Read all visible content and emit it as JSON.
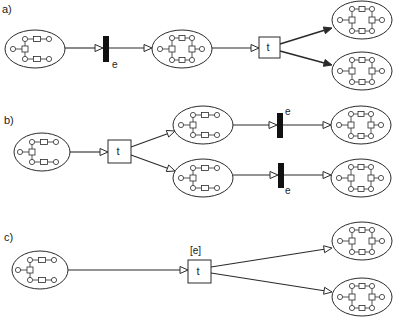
{
  "panels": [
    {
      "label": "a)",
      "label_pos": [
        2,
        4
      ],
      "nets": [
        {
          "id": "a-src",
          "cx": 35,
          "cy": 49,
          "rx": 30,
          "ry": 19,
          "variant": "open"
        },
        {
          "id": "a-mid",
          "cx": 182,
          "cy": 49,
          "rx": 30,
          "ry": 19,
          "variant": "closed"
        },
        {
          "id": "a-out1",
          "cx": 362,
          "cy": 20,
          "rx": 30,
          "ry": 19,
          "variant": "closed"
        },
        {
          "id": "a-out2",
          "cx": 362,
          "cy": 71,
          "rx": 30,
          "ry": 19,
          "variant": "closed"
        }
      ],
      "transitions": [
        {
          "id": "a-e",
          "type": "bar",
          "x": 103,
          "y": 36,
          "w": 6,
          "h": 26,
          "label": "e",
          "label_pos": [
            112,
            60
          ]
        },
        {
          "id": "a-t",
          "type": "box",
          "x": 259,
          "y": 37,
          "w": 21,
          "h": 21,
          "label": "t"
        }
      ],
      "arcs": [
        {
          "from": [
            65,
            48
          ],
          "to": [
            103,
            48
          ],
          "head": "open"
        },
        {
          "from": [
            109,
            48
          ],
          "to": [
            152,
            48
          ],
          "head": "open"
        },
        {
          "from": [
            212,
            48
          ],
          "to": [
            259,
            48
          ],
          "head": "open"
        },
        {
          "from": [
            280,
            44
          ],
          "to": [
            332,
            28
          ],
          "head": "filled"
        },
        {
          "from": [
            280,
            51
          ],
          "to": [
            332,
            65
          ],
          "head": "filled"
        }
      ]
    },
    {
      "label": "b)",
      "label_pos": [
        4,
        115
      ],
      "nets": [
        {
          "id": "b-src",
          "cx": 42,
          "cy": 152,
          "rx": 28,
          "ry": 19,
          "variant": "open"
        },
        {
          "id": "b-mid1",
          "cx": 203,
          "cy": 125,
          "rx": 30,
          "ry": 19,
          "variant": "open-right"
        },
        {
          "id": "b-mid2",
          "cx": 203,
          "cy": 178,
          "rx": 30,
          "ry": 19,
          "variant": "open-right"
        },
        {
          "id": "b-out1",
          "cx": 361,
          "cy": 125,
          "rx": 30,
          "ry": 19,
          "variant": "closed"
        },
        {
          "id": "b-out2",
          "cx": 361,
          "cy": 178,
          "rx": 30,
          "ry": 19,
          "variant": "closed"
        }
      ],
      "transitions": [
        {
          "id": "b-t",
          "type": "box",
          "x": 108,
          "y": 140,
          "w": 23,
          "h": 23,
          "label": "t"
        },
        {
          "id": "b-e1",
          "type": "bar",
          "x": 277,
          "y": 113,
          "w": 6,
          "h": 25,
          "label": "e",
          "label_pos": [
            285,
            107
          ]
        },
        {
          "id": "b-e2",
          "type": "bar",
          "x": 278,
          "y": 163,
          "w": 6,
          "h": 25,
          "label": "e",
          "label_pos": [
            285,
            186
          ]
        }
      ],
      "arcs": [
        {
          "from": [
            70,
            152
          ],
          "to": [
            108,
            152
          ],
          "head": "open"
        },
        {
          "from": [
            131,
            147
          ],
          "to": [
            175,
            131
          ],
          "head": "open"
        },
        {
          "from": [
            131,
            155
          ],
          "to": [
            175,
            171
          ],
          "head": "open"
        },
        {
          "from": [
            233,
            125
          ],
          "to": [
            277,
            125
          ],
          "head": "open"
        },
        {
          "from": [
            283,
            125
          ],
          "to": [
            331,
            125
          ],
          "head": "open"
        },
        {
          "from": [
            233,
            175
          ],
          "to": [
            278,
            175
          ],
          "head": "open"
        },
        {
          "from": [
            284,
            175
          ],
          "to": [
            331,
            175
          ],
          "head": "open"
        }
      ]
    },
    {
      "label": "c)",
      "label_pos": [
        4,
        232
      ],
      "nets": [
        {
          "id": "c-src",
          "cx": 40,
          "cy": 270,
          "rx": 28,
          "ry": 19,
          "variant": "open"
        },
        {
          "id": "c-out1",
          "cx": 362,
          "cy": 241,
          "rx": 30,
          "ry": 19,
          "variant": "closed"
        },
        {
          "id": "c-out2",
          "cx": 362,
          "cy": 297,
          "rx": 30,
          "ry": 19,
          "variant": "closed"
        }
      ],
      "transitions": [
        {
          "id": "c-t",
          "type": "box",
          "x": 188,
          "y": 260,
          "w": 23,
          "h": 23,
          "label": "t",
          "top_label": "[e]",
          "top_label_pos": [
            190,
            246
          ]
        }
      ],
      "arcs": [
        {
          "from": [
            68,
            270
          ],
          "to": [
            188,
            270
          ],
          "head": "open"
        },
        {
          "from": [
            211,
            267
          ],
          "to": [
            332,
            248
          ],
          "head": "open"
        },
        {
          "from": [
            211,
            273
          ],
          "to": [
            332,
            292
          ],
          "head": "open"
        }
      ]
    }
  ],
  "colors": {
    "stroke": "#2a2a2a",
    "bar": "#111111",
    "background": "#ffffff"
  }
}
